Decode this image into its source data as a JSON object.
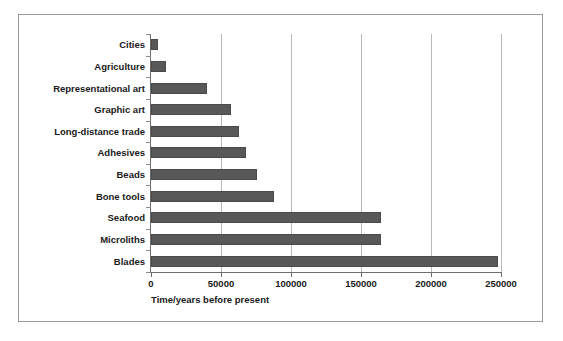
{
  "chart_data": {
    "type": "bar",
    "orientation": "horizontal",
    "title": "",
    "xlabel": "Time/years before present",
    "ylabel": "",
    "xlim": [
      0,
      250000
    ],
    "ylim": null,
    "grid": "vertical",
    "legend": "none",
    "xticks": [
      0,
      50000,
      100000,
      150000,
      200000,
      250000
    ],
    "xticklabels": [
      "0",
      "50000",
      "100000",
      "150000",
      "200000",
      "250000"
    ],
    "categories": [
      "Cities",
      "Agriculture",
      "Representational art",
      "Graphic art",
      "Long-distance trade",
      "Adhesives",
      "Beads",
      "Bone tools",
      "Seafood",
      "Microliths",
      "Blades"
    ],
    "values": [
      5000,
      11000,
      40000,
      57000,
      63000,
      68000,
      76000,
      88000,
      164000,
      164000,
      248000
    ],
    "series": [
      {
        "name": "Time/years before present",
        "values": [
          5000,
          11000,
          40000,
          57000,
          63000,
          68000,
          76000,
          88000,
          164000,
          164000,
          248000
        ]
      }
    ],
    "colors": {
      "bar_fill": "#585858",
      "bar_edge": "#4a4a4a",
      "gridline": "#b9b9b9",
      "axis": "#6d6d6d",
      "frame_border": "#9a9a9a",
      "background": "#ffffff",
      "text": "#1a1a1a"
    }
  }
}
